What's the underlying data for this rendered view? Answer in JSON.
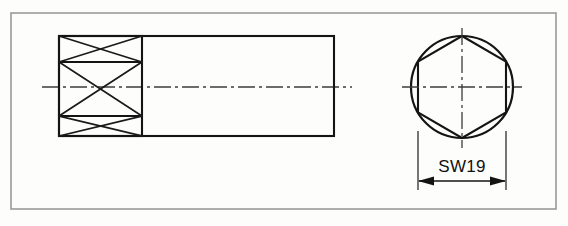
{
  "drawing": {
    "title": "Hex socket technical drawing",
    "background_color": "#fdfdfc",
    "line_color": "#141414",
    "frame_color": "#9a9a9a",
    "centerline_color": "#3c3c3c"
  },
  "frame": {
    "name": "drawing-border",
    "x": 11,
    "y": 13,
    "width": 545,
    "height": 196
  },
  "side_view": {
    "name": "side-elevation-view",
    "body": {
      "x": 59,
      "y": 36,
      "width": 275,
      "height": 100
    },
    "hatched_section": {
      "x": 59,
      "y": 36,
      "width": 83,
      "height": 100,
      "cell_count": 3,
      "divider_y": [
        62,
        116
      ],
      "cells": [
        {
          "label": "hatch-cell-top",
          "y_top": 36,
          "y_bottom": 62
        },
        {
          "label": "hatch-cell-middle",
          "y_top": 62,
          "y_bottom": 116
        },
        {
          "label": "hatch-cell-bottom",
          "y_top": 116,
          "y_bottom": 136
        }
      ]
    },
    "centerline": {
      "x1": 42,
      "x2": 352,
      "y": 87
    }
  },
  "end_view": {
    "name": "end-view",
    "circle": {
      "cx": 462,
      "cy": 87,
      "r": 51
    },
    "hexagon": {
      "cx": 462,
      "cy": 87,
      "across_flats_radius": 44,
      "orientation": "point-up"
    },
    "centerline_horizontal": {
      "x1": 402,
      "x2": 522,
      "y": 87
    },
    "centerline_vertical": {
      "x": 462,
      "y1": 28,
      "y2": 148
    }
  },
  "dimension": {
    "name": "across-flats-dimension",
    "label": "SW19",
    "value": 19,
    "unit": "mm",
    "meaning": "across-flats wrench size",
    "line_y": 181,
    "x_left": 418,
    "x_right": 506,
    "extension_top_y": 131,
    "extension_bottom_y": 190,
    "text_x": 462,
    "text_y": 172
  }
}
